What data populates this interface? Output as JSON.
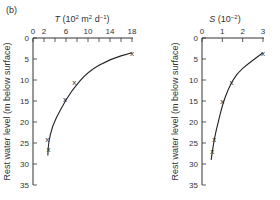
{
  "panel_label": "(b)",
  "chart_data": [
    {
      "type": "scatter",
      "title": "",
      "xlabel": "T (10^2 m^2 d^-1)",
      "xlabel_parts": {
        "sym": "T",
        "unit": "(10",
        "sup1": "2",
        "mid": " m",
        "sup2": "2",
        "mid2": " d",
        "sup3": "−1",
        "end": ")"
      },
      "ylabel": "Rest water level (m below surface)",
      "x_ticks": [
        0,
        2,
        6,
        10,
        14,
        18
      ],
      "x_minor_ticks": [
        0,
        2,
        4,
        6,
        8,
        10,
        12,
        14,
        16,
        18
      ],
      "y_ticks": [
        0,
        5,
        10,
        15,
        20,
        25,
        30,
        35
      ],
      "xlim": [
        0,
        18
      ],
      "ylim": [
        0,
        35
      ],
      "y_inverted": true,
      "x_axis_position": "top",
      "points": [
        {
          "x": 18,
          "y": 3.5
        },
        {
          "x": 7.5,
          "y": 10.5
        },
        {
          "x": 5.8,
          "y": 14.5
        },
        {
          "x": 2.6,
          "y": 24
        },
        {
          "x": 2.8,
          "y": 26.5
        }
      ],
      "fit_curve": [
        [
          18,
          3.5
        ],
        [
          14,
          5
        ],
        [
          10,
          8
        ],
        [
          7,
          12.5
        ],
        [
          5,
          17
        ],
        [
          3.5,
          21
        ],
        [
          2.8,
          25
        ],
        [
          2.7,
          28
        ]
      ]
    },
    {
      "type": "scatter",
      "title": "",
      "xlabel": "S (10^-2)",
      "xlabel_parts": {
        "sym": "S",
        "unit": "(10",
        "sup1": "−2",
        "end": ")"
      },
      "ylabel": "Rest water level (m below surface)",
      "x_ticks": [
        0,
        1,
        2,
        3
      ],
      "y_ticks": [
        0,
        5,
        10,
        15,
        20,
        25,
        30,
        35
      ],
      "xlim": [
        0,
        3
      ],
      "ylim": [
        0,
        35
      ],
      "y_inverted": true,
      "x_axis_position": "top",
      "points": [
        {
          "x": 3.0,
          "y": 3.5
        },
        {
          "x": 1.45,
          "y": 10.5
        },
        {
          "x": 1.0,
          "y": 15
        },
        {
          "x": 0.6,
          "y": 24
        },
        {
          "x": 0.5,
          "y": 27
        }
      ],
      "fit_curve": [
        [
          3,
          3.5
        ],
        [
          2.3,
          6
        ],
        [
          1.7,
          8.5
        ],
        [
          1.3,
          12
        ],
        [
          1.0,
          16
        ],
        [
          0.8,
          20
        ],
        [
          0.6,
          24
        ],
        [
          0.45,
          29
        ]
      ]
    }
  ]
}
